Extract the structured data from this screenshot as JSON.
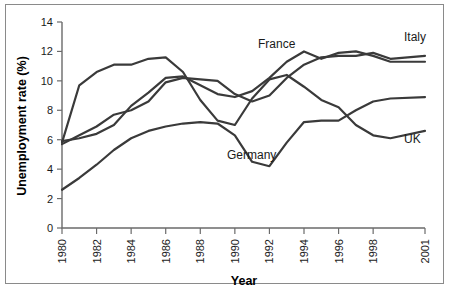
{
  "chart_data": {
    "type": "line",
    "title": "",
    "xlabel": "Year",
    "ylabel": "Unemployment rate (%)",
    "xlim": [
      1980,
      2001
    ],
    "ylim": [
      0,
      14
    ],
    "grid": false,
    "legend_position": "inline-end-labels",
    "x_tick_labels": [
      "1980",
      "1982",
      "1984",
      "1986",
      "1988",
      "1990",
      "1992",
      "1994",
      "1996",
      "1998",
      "2001"
    ],
    "x_tick_values": [
      1980,
      1982,
      1984,
      1986,
      1988,
      1990,
      1992,
      1994,
      1996,
      1998,
      2001
    ],
    "y_tick_labels": [
      "0",
      "2",
      "4",
      "6",
      "8",
      "10",
      "12",
      "14"
    ],
    "y_tick_values": [
      0,
      2,
      4,
      6,
      8,
      10,
      12,
      14
    ],
    "x": [
      1980,
      1981,
      1982,
      1983,
      1984,
      1985,
      1986,
      1987,
      1988,
      1989,
      1990,
      1991,
      1992,
      1993,
      1994,
      1995,
      1996,
      1997,
      1998,
      1999,
      2001
    ],
    "series": [
      {
        "name": "UK",
        "label": "UK",
        "color": "#3a3a3a",
        "values": [
          5.8,
          9.7,
          10.6,
          11.1,
          11.1,
          11.5,
          11.6,
          10.6,
          8.7,
          7.3,
          7.0,
          8.8,
          10.1,
          10.4,
          9.6,
          8.7,
          8.2,
          7.0,
          6.3,
          6.1,
          6.6
        ]
      },
      {
        "name": "Italy",
        "label": "Italy",
        "color": "#3a3a3a",
        "values": [
          5.7,
          6.3,
          6.9,
          7.7,
          8.0,
          8.6,
          9.9,
          10.2,
          10.1,
          10.0,
          9.1,
          8.6,
          9.0,
          10.2,
          11.1,
          11.6,
          11.7,
          11.7,
          11.9,
          11.5,
          11.7
        ]
      },
      {
        "name": "France",
        "label": "France",
        "color": "#3a3a3a",
        "values": [
          5.9,
          6.1,
          6.4,
          7.0,
          8.3,
          9.2,
          10.2,
          10.3,
          9.7,
          9.1,
          8.9,
          9.3,
          10.2,
          11.3,
          12.0,
          11.5,
          11.9,
          12.0,
          11.7,
          11.3,
          11.3
        ]
      },
      {
        "name": "Germany",
        "label": "Germany",
        "color": "#3a3a3a",
        "values": [
          2.6,
          3.4,
          4.3,
          5.3,
          6.1,
          6.6,
          6.9,
          7.1,
          7.2,
          7.1,
          6.3,
          4.5,
          4.2,
          5.8,
          7.2,
          7.3,
          7.3,
          8.0,
          8.6,
          8.8,
          8.9
        ]
      }
    ],
    "series_label_positions": [
      {
        "name": "France",
        "x": 258,
        "y": 48
      },
      {
        "name": "Italy",
        "x": 404,
        "y": 41
      },
      {
        "name": "UK",
        "x": 404,
        "y": 143
      },
      {
        "name": "Germany",
        "x": 227,
        "y": 159
      }
    ]
  }
}
